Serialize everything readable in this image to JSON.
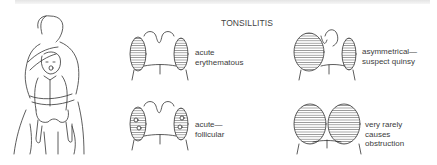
{
  "diagram": {
    "title": "TONSILLITIS",
    "figure": "adult-holding-child-for-throat-examination",
    "panels": [
      {
        "id": "acute-erythematous",
        "lines": [
          "acute",
          "erythematous"
        ],
        "variant": "symmetric-small"
      },
      {
        "id": "asymmetrical-suspect-quinsy",
        "lines": [
          "asymmetrical—",
          "suspect quinsy"
        ],
        "variant": "asymmetric"
      },
      {
        "id": "acute-follicular",
        "lines": [
          "acute—",
          "follicular"
        ],
        "variant": "follicular"
      },
      {
        "id": "very-rarely-causes-obstruction",
        "lines": [
          "very rarely",
          "causes",
          "obstruction"
        ],
        "variant": "enlarged-meeting"
      }
    ],
    "colors": {
      "ink": "#333333",
      "text": "#3c3c3c",
      "background": "#ffffff"
    }
  }
}
